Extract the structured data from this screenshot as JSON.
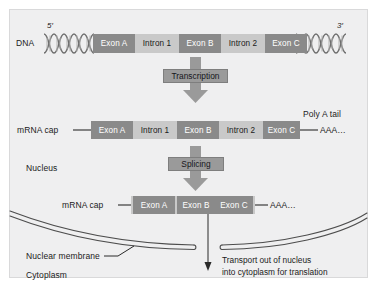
{
  "diagram": {
    "background_color": "#efeff0",
    "frame_border_color": "#d9d9da",
    "exon_color": "#8a8a8a",
    "intron_color": "#c9c9c9",
    "arrow_color": "#9a9a9a",
    "text_color": "#1b1b1b"
  },
  "dna_row": {
    "label": "DNA",
    "five_prime": "5′",
    "three_prime": "3′",
    "segments": [
      {
        "label": "Exon A",
        "type": "exon"
      },
      {
        "label": "Intron 1",
        "type": "intron"
      },
      {
        "label": "Exon B",
        "type": "exon"
      },
      {
        "label": "Intron 2",
        "type": "intron"
      },
      {
        "label": "Exon C",
        "type": "exon"
      }
    ]
  },
  "transcription": {
    "label": "Transcription"
  },
  "pre_mrna_row": {
    "cap_label": "mRNA cap",
    "poly_a_label": "Poly A tail",
    "poly_a_text": "AAA…",
    "segments": [
      {
        "label": "Exon A",
        "type": "exon"
      },
      {
        "label": "Intron 1",
        "type": "intron"
      },
      {
        "label": "Exon B",
        "type": "exon"
      },
      {
        "label": "Intron 2",
        "type": "intron"
      },
      {
        "label": "Exon C",
        "type": "exon"
      }
    ]
  },
  "nucleus_label": "Nucleus",
  "splicing": {
    "label": "Splicing"
  },
  "mature_mrna_row": {
    "cap_label": "mRNA cap",
    "poly_a_text": "AAA…",
    "segments": [
      {
        "label": "Exon A",
        "type": "exon"
      },
      {
        "label": "Exon B",
        "type": "exon"
      },
      {
        "label": "Exon C",
        "type": "exon"
      }
    ]
  },
  "membrane": {
    "label": "Nuclear membrane"
  },
  "cytoplasm": {
    "label": "Cytoplasm"
  },
  "transport": {
    "line1": "Transport out of nucleus",
    "line2": "into cytoplasm for translation"
  }
}
